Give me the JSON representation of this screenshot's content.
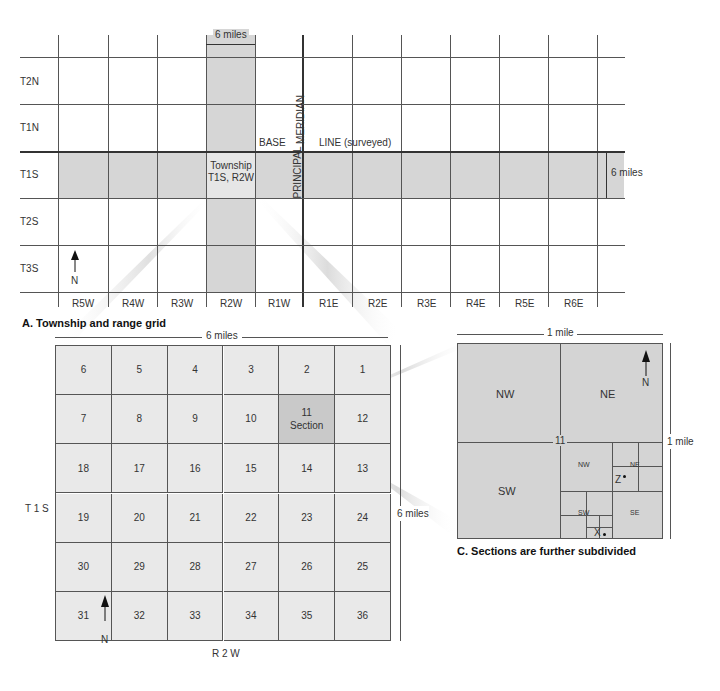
{
  "panel_a": {
    "caption": "A. Township and range grid",
    "top_dimension": "6 miles",
    "right_dimension": "6 miles",
    "townships": [
      "T2N",
      "T1N",
      "T1S",
      "T2S",
      "T3S"
    ],
    "ranges": [
      "R5W",
      "R4W",
      "R3W",
      "R2W",
      "R1W",
      "R1E",
      "R2E",
      "R3E",
      "R4E",
      "R5E",
      "R6E"
    ],
    "base_label": "BASE",
    "line_label": "LINE (surveyed)",
    "meridian_upper": "MERIDIAN",
    "meridian_lower": "PRINCIPAL",
    "highlight_township_line1": "Township",
    "highlight_township_line2": "T1S, R2W",
    "north_label": "N"
  },
  "panel_b": {
    "top_dimension": "6 miles",
    "right_dimension": "6 miles",
    "left_label": "T 1 S",
    "bottom_label": "R 2 W",
    "section_word": "Section",
    "highlighted_section": "11",
    "north_label": "N",
    "rows": [
      [
        "6",
        "5",
        "4",
        "3",
        "2",
        "1"
      ],
      [
        "7",
        "8",
        "9",
        "10",
        "11",
        "12"
      ],
      [
        "18",
        "17",
        "16",
        "15",
        "14",
        "13"
      ],
      [
        "19",
        "20",
        "21",
        "22",
        "23",
        "24"
      ],
      [
        "30",
        "29",
        "28",
        "27",
        "26",
        "25"
      ],
      [
        "31",
        "32",
        "33",
        "34",
        "35",
        "36"
      ]
    ]
  },
  "panel_c": {
    "caption": "C. Sections are further subdivided",
    "top_dimension": "1 mile",
    "right_dimension": "1 mile",
    "section_number": "11",
    "quarters": {
      "nw": "NW",
      "ne": "NE",
      "sw": "SW"
    },
    "se_quarter": {
      "nw": "NW",
      "ne": "NE",
      "sw": "SW",
      "se": "SE"
    },
    "point_z": "Z",
    "point_x": "X",
    "north_label": "N"
  },
  "colors": {
    "shade": "#d6d6d6",
    "highlight_township": "#e6e6e6",
    "section_fill": "#e9e9e9",
    "section_highlight": "#c9c9c9",
    "panel_c_fill": "#d4d4d4",
    "line": "#555555"
  }
}
